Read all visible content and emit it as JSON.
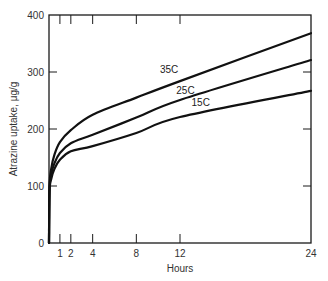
{
  "chart_data": {
    "type": "line",
    "title": "",
    "xlabel": "Hours",
    "ylabel": "Atrazine uptake, μg/g",
    "xlim": [
      0,
      24
    ],
    "ylim": [
      0,
      400
    ],
    "x_ticks": [
      1,
      2,
      4,
      8,
      12,
      24
    ],
    "x_tick_labels": [
      "1",
      "2",
      "4",
      "8",
      "12",
      "24"
    ],
    "y_ticks": [
      0,
      100,
      200,
      300,
      400
    ],
    "y_tick_labels": [
      "0",
      "100",
      "200",
      "300",
      "400"
    ],
    "grid": false,
    "legend": "inline labels on curves",
    "x": [
      0,
      0.05,
      0.2,
      0.5,
      1,
      2,
      4,
      8,
      12,
      24
    ],
    "series": [
      {
        "name": "35C",
        "values": [
          0,
          100,
          130,
          155,
          177,
          198,
          225,
          255,
          284,
          368
        ]
      },
      {
        "name": "25C",
        "values": [
          0,
          95,
          120,
          140,
          158,
          175,
          190,
          220,
          251,
          321
        ]
      },
      {
        "name": "15C",
        "values": [
          0,
          90,
          112,
          130,
          146,
          161,
          170,
          193,
          221,
          267
        ]
      }
    ],
    "annotations": [
      {
        "text": "35C",
        "x": 11.0,
        "y": 298
      },
      {
        "text": "25C",
        "x": 12.5,
        "y": 262
      },
      {
        "text": "15C",
        "x": 13.9,
        "y": 240
      }
    ]
  }
}
